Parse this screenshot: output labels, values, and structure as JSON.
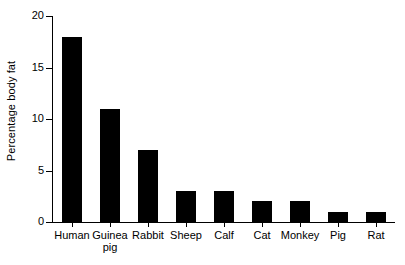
{
  "chart_data": {
    "type": "bar",
    "title": "",
    "subtitle": "",
    "xlabel": "",
    "ylabel": "Percentage body fat",
    "categories": [
      "Human",
      "Guinea\npig",
      "Rabbit",
      "Sheep",
      "Calf",
      "Cat",
      "Monkey",
      "Pig",
      "Rat"
    ],
    "values": [
      18,
      11,
      7,
      3,
      3,
      2,
      2,
      1,
      1
    ],
    "ylim": [
      0,
      20
    ],
    "yticks": [
      0,
      5,
      10,
      15,
      20
    ],
    "ytick_labels": [
      "0",
      "5",
      "10",
      "15",
      "20"
    ],
    "grid": false,
    "legend": false,
    "legend_position": "none",
    "bar_color": "#000000",
    "background_color": "#ffffff",
    "axis_color": "#000000"
  },
  "axis": {
    "y_title": "Percentage body fat",
    "ticks": [
      {
        "value": 20,
        "label": "20"
      },
      {
        "value": 15,
        "label": "15"
      },
      {
        "value": 10,
        "label": "10"
      },
      {
        "value": 5,
        "label": "5"
      },
      {
        "value": 0,
        "label": "0"
      }
    ]
  },
  "bars": [
    {
      "label": "Human",
      "value": 18
    },
    {
      "label": "Guinea\npig",
      "value": 11
    },
    {
      "label": "Rabbit",
      "value": 7
    },
    {
      "label": "Sheep",
      "value": 3
    },
    {
      "label": "Calf",
      "value": 3
    },
    {
      "label": "Cat",
      "value": 2
    },
    {
      "label": "Monkey",
      "value": 2
    },
    {
      "label": "Pig",
      "value": 1
    },
    {
      "label": "Rat",
      "value": 1
    }
  ]
}
